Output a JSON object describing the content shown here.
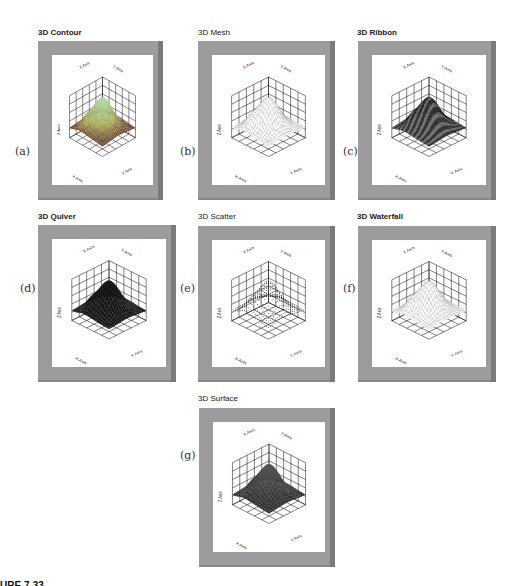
{
  "figure": {
    "caption": "URE 7-33",
    "panels": [
      {
        "id": "a",
        "letter": "(a)",
        "title": "3D Contour",
        "style": "contour",
        "axes": {
          "x": "X Axis",
          "y": "Y Axis",
          "z": "Z Axis"
        }
      },
      {
        "id": "b",
        "letter": "(b)",
        "title": "3D Mesh",
        "style": "mesh",
        "axes": {
          "x": "X Axis",
          "y": "Y Axis",
          "z": "Z Axis"
        }
      },
      {
        "id": "c",
        "letter": "(c)",
        "title": "3D Ribbon",
        "style": "ribbon",
        "axes": {
          "x": "X Axis",
          "y": "Y Axis",
          "z": "Z Axis"
        }
      },
      {
        "id": "d",
        "letter": "(d)",
        "title": "3D Quiver",
        "style": "quiver",
        "axes": {
          "x": "X Axis",
          "y": "Y Axis",
          "z": "Z Axis"
        }
      },
      {
        "id": "e",
        "letter": "(e)",
        "title": "3D Scatter",
        "style": "scatter",
        "axes": {
          "x": "X Axis",
          "y": "Y Axis",
          "z": "Z Axis"
        }
      },
      {
        "id": "f",
        "letter": "(f)",
        "title": "3D Waterfall",
        "style": "waterfall",
        "axes": {
          "x": "X Axis",
          "y": "Y Axis",
          "z": "Z Axis"
        }
      },
      {
        "id": "g",
        "letter": "(g)",
        "title": "3D Surface",
        "style": "surface",
        "axes": {
          "x": "X Axis",
          "y": "Y Axis",
          "z": "Z Axis"
        }
      }
    ]
  },
  "colors": {
    "frame": "#9c9c9c",
    "frame_shadow": "#7a7a7a",
    "plot_bg": "#ffffff",
    "grid": "#111111"
  }
}
